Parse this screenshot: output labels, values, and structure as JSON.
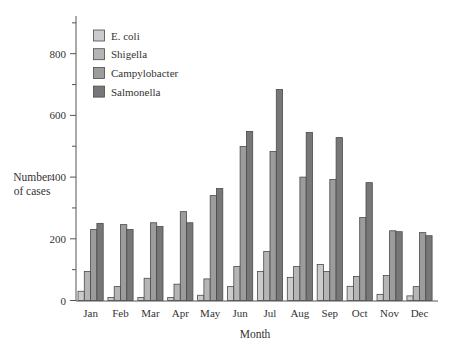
{
  "chart_data": {
    "type": "bar",
    "title": "",
    "xlabel": "Month",
    "ylabel": "Number of cases",
    "ylabel_lines": [
      "Number",
      "of cases"
    ],
    "ylim": [
      0,
      900
    ],
    "yticks": [
      0,
      200,
      400,
      600,
      800
    ],
    "grid": false,
    "legend_position": "top-left",
    "categories": [
      "Jan",
      "Feb",
      "Mar",
      "Apr",
      "May",
      "Jun",
      "Jul",
      "Aug",
      "Sep",
      "Oct",
      "Nov",
      "Dec"
    ],
    "series": [
      {
        "name": "E. coli",
        "color": "#cbcbcb",
        "values": [
          30,
          10,
          10,
          10,
          17,
          45,
          94,
          75,
          117,
          46,
          20,
          15
        ]
      },
      {
        "name": "Shigella",
        "color": "#b5b5b5",
        "values": [
          94,
          45,
          72,
          53,
          70,
          110,
          159,
          110,
          94,
          78,
          81,
          45
        ]
      },
      {
        "name": "Campylobacter",
        "color": "#9c9c9c",
        "values": [
          230,
          246,
          252,
          288,
          340,
          499,
          483,
          400,
          392,
          269,
          226,
          220
        ]
      },
      {
        "name": "Salmonella",
        "color": "#777777",
        "values": [
          250,
          230,
          240,
          252,
          363,
          548,
          684,
          545,
          528,
          382,
          223,
          210
        ]
      }
    ]
  }
}
